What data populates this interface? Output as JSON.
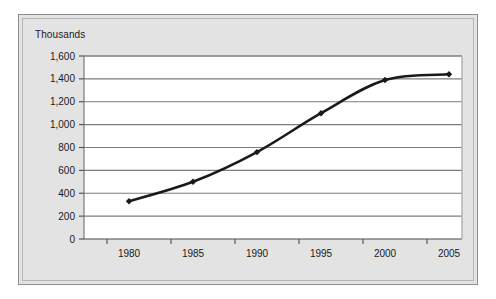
{
  "chart_data": {
    "type": "line",
    "title": "",
    "axis_title": "Thousands",
    "xlabel": "",
    "ylabel": "Thousands",
    "categories": [
      "1980",
      "1985",
      "1990",
      "1995",
      "2000",
      "2005"
    ],
    "x": [
      1980,
      1985,
      1990,
      1995,
      2000,
      2005
    ],
    "values": [
      330,
      500,
      760,
      1100,
      1390,
      1440
    ],
    "series": [
      {
        "name": "",
        "values": [
          330,
          500,
          760,
          1100,
          1390,
          1440
        ]
      }
    ],
    "ylim": [
      0,
      1600
    ],
    "ytick_labels": [
      "0",
      "200",
      "400",
      "600",
      "800",
      "1,000",
      "1,200",
      "1,400",
      "1,600"
    ],
    "ytick_values": [
      0,
      200,
      400,
      600,
      800,
      1000,
      1200,
      1400,
      1600
    ],
    "xtick_labels": [
      "1980",
      "1985",
      "1990",
      "1995",
      "2000",
      "2005"
    ],
    "grid": true,
    "grid_axis": "y",
    "legend": false,
    "legend_position": "none",
    "marker": "diamond",
    "line_color": "#1a1a1a",
    "marker_color": "#1a1a1a",
    "grid_color": "#7d7d7d",
    "plot_background": "#ffffff",
    "figure_background": "#e3e3e3",
    "smooth": true
  }
}
